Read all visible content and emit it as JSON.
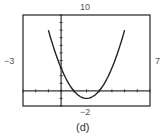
{
  "chart_data": {
    "type": "line",
    "title": "",
    "caption": "(d)",
    "xlabel": "",
    "ylabel": "",
    "xlim": [
      -3,
      7
    ],
    "ylim": [
      -2,
      10
    ],
    "xscale": 1,
    "yscale": 1,
    "grid": false,
    "window_labels": {
      "ymax": "10",
      "xmin": "−3",
      "xmax": "7",
      "ymin": "−2"
    },
    "series": [
      {
        "name": "y = x^2 - 4x + 3",
        "x": [
          -1,
          0,
          1,
          2,
          3,
          4,
          5
        ],
        "y": [
          8,
          3,
          0,
          -1,
          0,
          3,
          8
        ]
      }
    ]
  }
}
